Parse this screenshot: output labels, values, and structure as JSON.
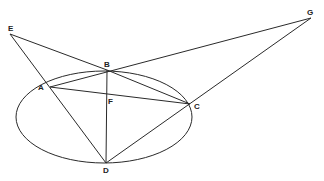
{
  "diagram": {
    "points": {
      "E": {
        "label": "E",
        "x": 10,
        "y": 34,
        "lx": 8,
        "ly": 31
      },
      "B": {
        "label": "B",
        "x": 107,
        "y": 70,
        "lx": 104,
        "ly": 67
      },
      "G": {
        "label": "G",
        "x": 311,
        "y": 18,
        "lx": 307,
        "ly": 15
      },
      "A": {
        "label": "A",
        "x": 50,
        "y": 87,
        "lx": 38,
        "ly": 88
      },
      "F": {
        "label": "F",
        "x": 107,
        "y": 98,
        "lx": 108,
        "ly": 103
      },
      "C": {
        "label": "C",
        "x": 190,
        "y": 104,
        "lx": 194,
        "ly": 109
      },
      "D": {
        "label": "D",
        "x": 106,
        "y": 163,
        "lx": 103,
        "ly": 173
      }
    },
    "ellipse": {
      "cx": 104,
      "cy": 117,
      "rx": 88,
      "ry": 46
    },
    "segments": [
      [
        "E",
        "B"
      ],
      [
        "E",
        "D"
      ],
      [
        "B",
        "G"
      ],
      [
        "G",
        "C"
      ],
      [
        "A",
        "B"
      ],
      [
        "A",
        "C"
      ],
      [
        "B",
        "C"
      ],
      [
        "B",
        "D"
      ],
      [
        "D",
        "C"
      ],
      [
        "E",
        "C"
      ]
    ],
    "stroke_color": "#2a2a2a",
    "background": "#ffffff"
  }
}
